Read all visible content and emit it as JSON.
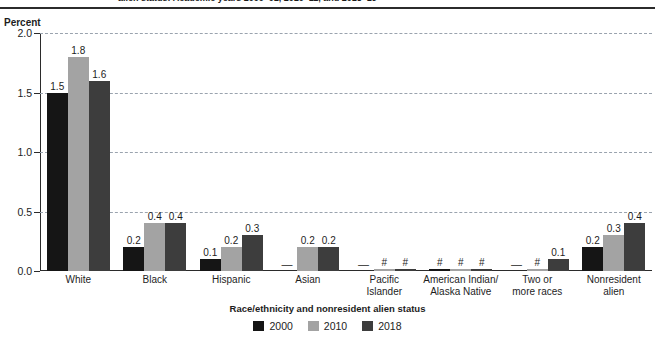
{
  "header": {
    "cropped_title": "alien status: Academic years 2000–01, 2010–11, and 2018–19"
  },
  "chart_data": {
    "type": "bar",
    "title": "",
    "xlabel": "Race/ethnicity and nonresident alien status",
    "ylabel": "Percent",
    "ylim": [
      0.0,
      2.0
    ],
    "yticks": [
      0.0,
      0.5,
      1.0,
      1.5,
      2.0
    ],
    "ytick_labels": [
      "0.0",
      "0.5",
      "1.0",
      "1.5",
      "2.0"
    ],
    "grid": true,
    "grid_style": "dashed-horizontal",
    "legend_position": "bottom-center",
    "categories": [
      "White",
      "Black",
      "Hispanic",
      "Asian",
      "Pacific Islander",
      "American Indian/ Alaska Native",
      "Two or more races",
      "Nonresident alien"
    ],
    "category_lines": [
      [
        "White"
      ],
      [
        "Black"
      ],
      [
        "Hispanic"
      ],
      [
        "Asian"
      ],
      [
        "Pacific",
        "Islander"
      ],
      [
        "American Indian/",
        "Alaska Native"
      ],
      [
        "Two or",
        "more races"
      ],
      [
        "Nonresident",
        "alien"
      ]
    ],
    "series": [
      {
        "name": "2000",
        "color": "#151515",
        "values": [
          1.5,
          0.2,
          0.1,
          null,
          null,
          0.0,
          null,
          0.2
        ],
        "labels": [
          "1.5",
          "0.2",
          "0.1",
          "—",
          "—",
          "#",
          "—",
          "0.2"
        ]
      },
      {
        "name": "2010",
        "color": "#a3a3a3",
        "values": [
          1.8,
          0.4,
          0.2,
          0.2,
          0.0,
          0.0,
          0.0,
          0.3
        ],
        "labels": [
          "1.8",
          "0.4",
          "0.2",
          "0.2",
          "#",
          "#",
          "#",
          "0.3"
        ]
      },
      {
        "name": "2018",
        "color": "#3d3d3d",
        "values": [
          1.6,
          0.4,
          0.3,
          0.2,
          0.0,
          0.0,
          0.1,
          0.4
        ],
        "labels": [
          "1.6",
          "0.4",
          "0.3",
          "0.2",
          "#",
          "#",
          "0.1",
          "0.4"
        ]
      }
    ]
  }
}
